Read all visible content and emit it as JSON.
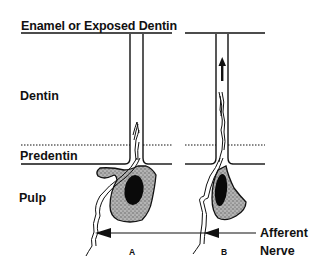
{
  "diagram": {
    "title": "Enamel or Exposed Dentin",
    "layers": {
      "dentin": "Dentin",
      "predentin": "Predentin",
      "pulp": "Pulp"
    },
    "panels": [
      {
        "label": "A",
        "state": "resting"
      },
      {
        "label": "B",
        "state": "fluid-flow-outward"
      }
    ],
    "nerve_label_line1": "Afferent",
    "nerve_label_line2": "Nerve",
    "colors": {
      "ink": "#111111",
      "background": "#ffffff",
      "cell_fill": "#9a9a9a",
      "nucleus": "#0a0a0a"
    }
  }
}
